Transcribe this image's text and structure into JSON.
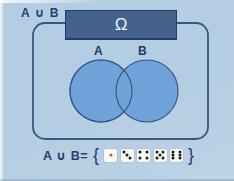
{
  "scene": {
    "top_left_label": "A ∪ B",
    "universe_label": "Ω"
  },
  "venn": {
    "set_a_label": "A",
    "set_b_label": "B"
  },
  "equation": {
    "lhs": "A ∪ B=",
    "open_brace": "{",
    "close_brace": "}",
    "dice": [
      {
        "value": 1,
        "pips": [
          "c"
        ],
        "pip_color": "#c8503c"
      },
      {
        "value": 3,
        "pips": [
          "tl",
          "c",
          "br"
        ],
        "pip_color": "#1d1d1f"
      },
      {
        "value": 4,
        "pips": [
          "tl",
          "tr",
          "bl",
          "br"
        ],
        "pip_color": "#1d1d1f"
      },
      {
        "value": 5,
        "pips": [
          "tl",
          "tr",
          "c",
          "bl",
          "br"
        ],
        "pip_color": "#1d1d1f"
      },
      {
        "value": 6,
        "pips": [
          "tl",
          "ml",
          "bl",
          "tr",
          "mr",
          "br"
        ],
        "pip_color": "#1d1d1f"
      }
    ]
  },
  "colors": {
    "background": "#b5cde2",
    "background_2": "#bdd3e6",
    "outline": "#3a5685",
    "set_fill": "#6fa2d8",
    "universe_box": "#45628e",
    "universe_box_border": "#283c5f",
    "text": "#21406f",
    "die_face": "#f8faf6",
    "pip_black": "#1d1d1f",
    "pip_red": "#c8503c"
  }
}
